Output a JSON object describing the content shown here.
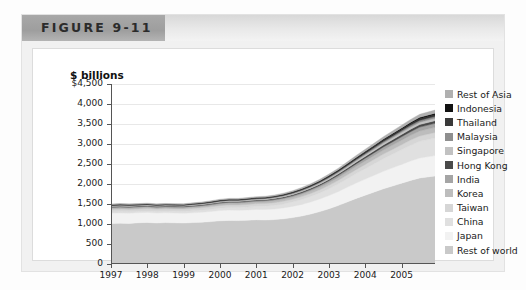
{
  "figure": {
    "tab_label": "FIGURE 9-11"
  },
  "chart_data": {
    "type": "area",
    "stacked": true,
    "title": "",
    "xlabel": "",
    "ylabel": "$ billions",
    "ylim": [
      0,
      4500
    ],
    "ytick_labels": [
      "$4,500",
      "4,000",
      "3,500",
      "3,000",
      "2,500",
      "2,000",
      "1,500",
      "1,000",
      "500",
      "0"
    ],
    "ytick_values": [
      4500,
      4000,
      3500,
      3000,
      2500,
      2000,
      1500,
      1000,
      500,
      0
    ],
    "grid": true,
    "legend_position": "right",
    "xlim": [
      1997,
      2005.92
    ],
    "xtick_labels": [
      "1997",
      "1998",
      "1999",
      "2000",
      "2001",
      "2002",
      "2003",
      "2004",
      "2005"
    ],
    "xtick_values": [
      1997,
      1998,
      1999,
      2000,
      2001,
      2002,
      2003,
      2004,
      2005
    ],
    "x": [
      1997.0,
      1997.25,
      1997.5,
      1997.75,
      1998.0,
      1998.25,
      1998.5,
      1998.75,
      1999.0,
      1999.25,
      1999.5,
      1999.75,
      2000.0,
      2000.25,
      2000.5,
      2000.75,
      2001.0,
      2001.25,
      2001.5,
      2001.75,
      2002.0,
      2002.25,
      2002.5,
      2002.75,
      2003.0,
      2003.25,
      2003.5,
      2003.75,
      2004.0,
      2004.25,
      2004.5,
      2004.75,
      2005.0,
      2005.25,
      2005.5,
      2005.92
    ],
    "series": [
      {
        "name": "Rest of world",
        "color": "#c9c9c9",
        "values": [
          1010,
          1020,
          1015,
          1030,
          1040,
          1025,
          1035,
          1030,
          1025,
          1035,
          1045,
          1060,
          1080,
          1090,
          1085,
          1095,
          1105,
          1100,
          1110,
          1130,
          1160,
          1200,
          1250,
          1310,
          1380,
          1460,
          1550,
          1640,
          1720,
          1800,
          1880,
          1950,
          2020,
          2090,
          2150,
          2200
        ]
      },
      {
        "name": "Japan",
        "color": "#f2f2f2",
        "values": [
          260,
          258,
          255,
          252,
          250,
          248,
          246,
          245,
          244,
          246,
          248,
          252,
          256,
          258,
          257,
          258,
          260,
          262,
          266,
          272,
          280,
          290,
          302,
          316,
          332,
          348,
          366,
          384,
          402,
          420,
          438,
          454,
          470,
          486,
          500,
          512
        ]
      },
      {
        "name": "China",
        "color": "#e0e0e0",
        "values": [
          30,
          32,
          34,
          36,
          38,
          40,
          42,
          44,
          46,
          49,
          52,
          56,
          60,
          64,
          68,
          72,
          78,
          84,
          92,
          100,
          110,
          122,
          136,
          152,
          170,
          190,
          212,
          236,
          262,
          288,
          314,
          340,
          366,
          392,
          416,
          436
        ]
      },
      {
        "name": "Taiwan",
        "color": "#d6d6d6",
        "values": [
          62,
          62,
          61,
          60,
          60,
          59,
          59,
          58,
          58,
          59,
          60,
          61,
          63,
          64,
          64,
          64,
          65,
          65,
          66,
          68,
          70,
          73,
          76,
          80,
          84,
          89,
          94,
          99,
          105,
          110,
          116,
          121,
          126,
          131,
          136,
          140
        ]
      },
      {
        "name": "Korea",
        "color": "#bdbdbd",
        "values": [
          34,
          34,
          33,
          32,
          31,
          30,
          30,
          30,
          31,
          32,
          34,
          36,
          38,
          40,
          41,
          42,
          43,
          44,
          46,
          48,
          51,
          54,
          58,
          62,
          67,
          72,
          77,
          83,
          89,
          95,
          101,
          107,
          113,
          119,
          124,
          128
        ]
      },
      {
        "name": "India",
        "color": "#a5a5a5",
        "values": [
          22,
          22,
          22,
          22,
          23,
          23,
          23,
          23,
          24,
          24,
          25,
          26,
          27,
          28,
          28,
          29,
          30,
          31,
          32,
          34,
          36,
          38,
          41,
          44,
          48,
          52,
          56,
          61,
          66,
          71,
          76,
          81,
          86,
          91,
          96,
          100
        ]
      },
      {
        "name": "Hong Kong",
        "color": "#4a4a4a",
        "values": [
          18,
          18,
          18,
          17,
          17,
          17,
          17,
          17,
          17,
          18,
          18,
          19,
          20,
          20,
          20,
          21,
          21,
          22,
          23,
          24,
          25,
          27,
          29,
          31,
          33,
          36,
          39,
          42,
          45,
          48,
          51,
          54,
          57,
          60,
          63,
          65
        ]
      },
      {
        "name": "Singapore",
        "color": "#c2c2c2",
        "values": [
          16,
          16,
          16,
          15,
          15,
          15,
          15,
          15,
          15,
          16,
          16,
          17,
          18,
          18,
          18,
          19,
          19,
          20,
          21,
          22,
          23,
          25,
          27,
          29,
          31,
          33,
          36,
          39,
          42,
          45,
          48,
          51,
          54,
          57,
          60,
          62
        ]
      },
      {
        "name": "Malaysia",
        "color": "#8f8f8f",
        "values": [
          12,
          12,
          12,
          11,
          11,
          11,
          11,
          11,
          11,
          12,
          12,
          13,
          13,
          14,
          14,
          14,
          15,
          15,
          16,
          17,
          18,
          19,
          20,
          22,
          24,
          26,
          28,
          30,
          32,
          34,
          36,
          38,
          40,
          42,
          44,
          46
        ]
      },
      {
        "name": "Thailand",
        "color": "#3a3a3a",
        "values": [
          10,
          10,
          10,
          9,
          9,
          9,
          9,
          9,
          9,
          10,
          10,
          11,
          11,
          12,
          12,
          12,
          13,
          13,
          14,
          15,
          16,
          17,
          18,
          19,
          21,
          22,
          24,
          26,
          28,
          30,
          32,
          34,
          36,
          38,
          40,
          41
        ]
      },
      {
        "name": "Indonesia",
        "color": "#121212",
        "values": [
          10,
          10,
          10,
          9,
          9,
          9,
          9,
          9,
          9,
          9,
          10,
          10,
          11,
          11,
          11,
          12,
          12,
          13,
          13,
          14,
          15,
          16,
          17,
          18,
          20,
          21,
          23,
          25,
          26,
          28,
          30,
          32,
          34,
          36,
          38,
          39
        ]
      },
      {
        "name": "Rest of Asia",
        "color": "#b0b0b0",
        "values": [
          18,
          18,
          18,
          18,
          18,
          18,
          18,
          18,
          18,
          19,
          19,
          20,
          21,
          21,
          22,
          22,
          23,
          24,
          25,
          26,
          28,
          30,
          32,
          35,
          38,
          41,
          44,
          48,
          52,
          56,
          60,
          64,
          68,
          72,
          76,
          79
        ]
      }
    ],
    "legend_order_top_to_bottom": [
      "Rest of Asia",
      "Indonesia",
      "Thailand",
      "Malaysia",
      "Singapore",
      "Hong Kong",
      "India",
      "Korea",
      "Taiwan",
      "China",
      "Japan",
      "Rest of world"
    ]
  }
}
